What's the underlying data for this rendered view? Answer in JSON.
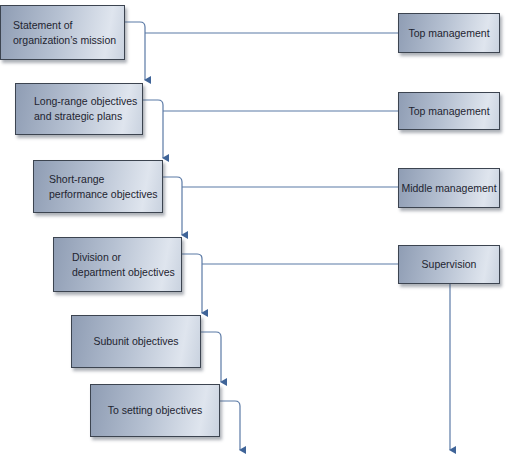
{
  "diagram": {
    "hierarchy": [
      {
        "label": "Statement of\norganization’s mission"
      },
      {
        "label": "Long-range objectives\nand strategic plans"
      },
      {
        "label": "Short-range\nperformance objectives"
      },
      {
        "label": "Division or\ndepartment objectives"
      },
      {
        "label": "Subunit objectives"
      },
      {
        "label": "To setting objectives"
      }
    ],
    "levels": [
      {
        "label": "Top management"
      },
      {
        "label": "Top management"
      },
      {
        "label": "Middle management"
      },
      {
        "label": "Supervision"
      }
    ],
    "colors": {
      "line": "#5b7aa6",
      "box_border": "#3c4450",
      "box_gradient_dark": "#8f9db4",
      "box_gradient_light": "#dfe5ee"
    }
  }
}
